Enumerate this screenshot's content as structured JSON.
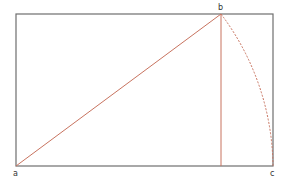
{
  "diagram": {
    "colors": {
      "frame": "#6e6e6e",
      "construction": "#c8735f",
      "label": "#333333"
    },
    "points": {
      "a": {
        "label": "a",
        "x": 16,
        "y": 166
      },
      "b": {
        "label": "b",
        "x": 221,
        "y": 14
      },
      "c": {
        "label": "c",
        "x": 273,
        "y": 166
      }
    },
    "frame": {
      "x": 16,
      "y": 14,
      "width": 257,
      "height": 152
    },
    "elements": [
      {
        "type": "line",
        "from": "a",
        "to": "b",
        "style": "solid"
      },
      {
        "type": "line",
        "from": "b",
        "to": "b_foot",
        "style": "solid"
      },
      {
        "type": "arc",
        "from": "b",
        "to": "c",
        "center": "a",
        "style": "dashed"
      }
    ]
  }
}
